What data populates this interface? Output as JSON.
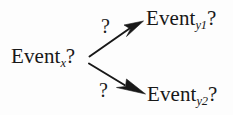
{
  "diagram": {
    "type": "branching-arrow-diagram",
    "background_color": "#fdfdfd",
    "ink_color": "#181818",
    "nodes": [
      {
        "id": "source",
        "base": "Event",
        "subscript": "x",
        "suffix": "?",
        "full_text": "Event_x?"
      },
      {
        "id": "target-1",
        "base": "Event",
        "subscript": "y1",
        "suffix": "?",
        "full_text": "Event_y1?"
      },
      {
        "id": "target-2",
        "base": "Event",
        "subscript": "y2",
        "suffix": "?",
        "full_text": "Event_y2?"
      }
    ],
    "edges": [
      {
        "id": "edge-1",
        "from": "source",
        "to": "target-1",
        "label": "?",
        "direction": "up-right",
        "arrowhead": "solid-filled"
      },
      {
        "id": "edge-2",
        "from": "source",
        "to": "target-2",
        "label": "?",
        "direction": "down-right",
        "arrowhead": "solid-filled"
      }
    ]
  }
}
